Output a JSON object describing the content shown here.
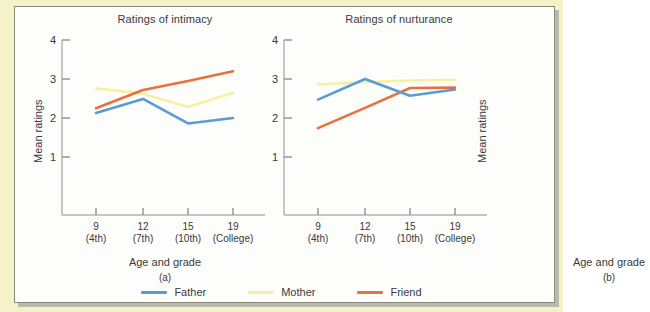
{
  "figure": {
    "frame_color": "#f5f1c9",
    "plate_color": "#fdfdfb"
  },
  "legend": {
    "position": "bottom-center",
    "items": [
      {
        "label": "Father",
        "color": "#5b9bd5",
        "icon": "line-swatch-icon"
      },
      {
        "label": "Mother",
        "color": "#f7f0a0",
        "icon": "line-swatch-icon"
      },
      {
        "label": "Friend",
        "color": "#e8713d",
        "icon": "line-swatch-icon"
      }
    ]
  },
  "chart_data": [
    {
      "type": "line",
      "title": "Ratings of intimacy",
      "panel_letter": "(a)",
      "xlabel": "Age and grade",
      "ylabel": "Mean ratings",
      "categories": [
        "9",
        "12",
        "15",
        "19"
      ],
      "category_sublabels": [
        "(4th)",
        "(7th)",
        "(10th)",
        "(College)"
      ],
      "ytick_labels": [
        "4",
        "3",
        "2",
        "1"
      ],
      "ylim": [
        0.5,
        4
      ],
      "grid": false,
      "series": [
        {
          "name": "Father",
          "color": "#5b9bd5",
          "values": [
            2.13,
            2.49,
            1.86,
            2.0
          ]
        },
        {
          "name": "Mother",
          "color": "#f7f0a0",
          "values": [
            2.76,
            2.62,
            2.28,
            2.65
          ]
        },
        {
          "name": "Friend",
          "color": "#e8713d",
          "values": [
            2.25,
            2.72,
            2.95,
            3.2
          ]
        }
      ]
    },
    {
      "type": "line",
      "title": "Ratings of nurturance",
      "panel_letter": "(b)",
      "xlabel": "Age and grade",
      "ylabel": "Mean ratings",
      "categories": [
        "9",
        "12",
        "15",
        "19"
      ],
      "category_sublabels": [
        "(4th)",
        "(7th)",
        "(10th)",
        "(College)"
      ],
      "ytick_labels": [
        "4",
        "3",
        "2",
        "1"
      ],
      "ylim": [
        0.5,
        4
      ],
      "grid": false,
      "series": [
        {
          "name": "Father",
          "color": "#5b9bd5",
          "values": [
            2.47,
            3.0,
            2.57,
            2.73
          ]
        },
        {
          "name": "Mother",
          "color": "#f7f0a0",
          "values": [
            2.86,
            2.92,
            2.96,
            2.98
          ]
        },
        {
          "name": "Friend",
          "color": "#e8713d",
          "values": [
            1.74,
            2.26,
            2.77,
            2.78
          ]
        }
      ]
    }
  ]
}
